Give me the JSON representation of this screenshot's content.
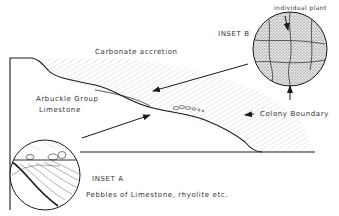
{
  "labels": {
    "carbonate_accretion": "Carbonate accretion",
    "inset_b": "INSET B",
    "individual_plant": "individual plant",
    "arbuckle_group": "Arbuckle Group",
    "limestone": "Limestone",
    "colony_boundary": "Colony Boundary",
    "inset_a": "INSET A",
    "pebbles": "Pebbles of Limestone, rhyolite  etc."
  },
  "colors": {
    "line": "#1a1a1a",
    "hatch": "#9a9a9a",
    "text": "#333333",
    "background": "#ffffff"
  }
}
